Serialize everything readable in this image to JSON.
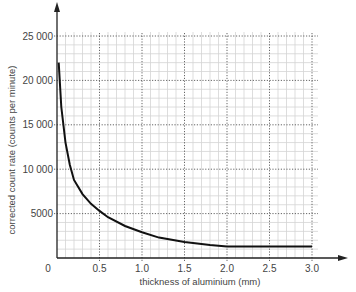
{
  "header_fragment": "below",
  "chart_data": {
    "type": "line",
    "title": "",
    "xlabel": "thickness of aluminium (mm)",
    "ylabel": "corrected count rate (counts per minute)",
    "xlim": [
      0,
      3.0
    ],
    "ylim": [
      0,
      25000
    ],
    "x_ticks": [
      "0",
      "0.5",
      "1.0",
      "1.5",
      "2.0",
      "2.5",
      "3.0"
    ],
    "y_ticks": [
      "5000",
      "10 000",
      "15 000",
      "20 000",
      "25 000"
    ],
    "grid": true,
    "series": [
      {
        "name": "corrected count rate",
        "x": [
          0.02,
          0.05,
          0.1,
          0.15,
          0.2,
          0.3,
          0.4,
          0.5,
          0.6,
          0.8,
          1.0,
          1.2,
          1.5,
          1.8,
          2.0,
          2.5,
          3.0
        ],
        "y": [
          22000,
          17000,
          13000,
          10500,
          8800,
          7200,
          6100,
          5300,
          4600,
          3600,
          2900,
          2300,
          1800,
          1450,
          1300,
          1300,
          1300
        ]
      }
    ]
  }
}
